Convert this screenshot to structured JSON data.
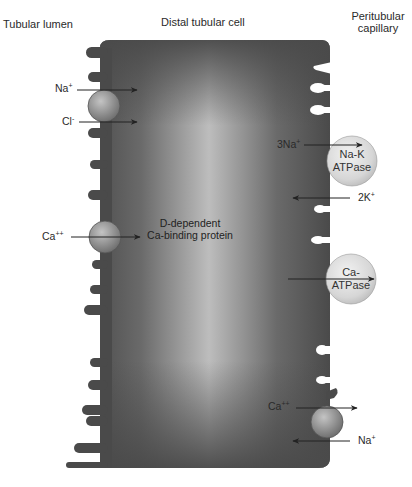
{
  "headers": {
    "left": "Tubular lumen",
    "center": "Distal tubular cell",
    "right_line1": "Peritubular",
    "right_line2": "capillary"
  },
  "colors": {
    "cell_dark": "#4a4a4a",
    "cell_light": "#b8b8b8",
    "sphere_small": "#8c8c8c",
    "sphere_large": "#d9d9d9",
    "arrow": "#222222"
  },
  "transporters": [
    {
      "id": "nacl-cotransporter",
      "membrane": "luminal",
      "ions": [
        {
          "label": "Na",
          "charge": "+",
          "direction": "into-cell"
        },
        {
          "label": "Cl",
          "charge": "-",
          "direction": "into-cell"
        }
      ]
    },
    {
      "id": "calcium-channel",
      "membrane": "luminal",
      "ions": [
        {
          "label": "Ca",
          "charge": "++",
          "direction": "into-cell"
        }
      ]
    },
    {
      "id": "na-k-atpase",
      "membrane": "basolateral",
      "label_line1": "Na-K",
      "label_line2": "ATPase",
      "ions": [
        {
          "label": "3Na",
          "charge": "+",
          "direction": "out-of-cell"
        },
        {
          "label": "2K",
          "charge": "+",
          "direction": "into-cell"
        }
      ]
    },
    {
      "id": "ca-atpase",
      "membrane": "basolateral",
      "label_line1": "Ca-",
      "label_line2": "ATPase",
      "ions": []
    },
    {
      "id": "na-ca-exchanger",
      "membrane": "basolateral",
      "ions": [
        {
          "label": "Ca",
          "charge": "++",
          "direction": "out-of-cell"
        },
        {
          "label": "Na",
          "charge": "+",
          "direction": "into-cell"
        }
      ]
    }
  ],
  "intracellular": {
    "protein_line1": "D-dependent",
    "protein_line2": "Ca-binding protein"
  }
}
